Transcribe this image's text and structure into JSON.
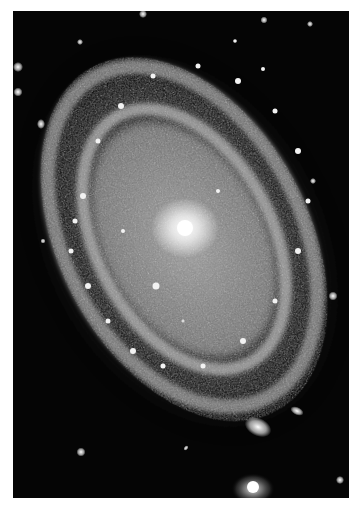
{
  "image": {
    "subject": "spiral galaxy",
    "colors": {
      "background": "#050505",
      "border": "#ffffff",
      "core": "#ffffff",
      "arms": "#bdbdbd"
    },
    "stars": [
      {
        "x": 5,
        "y": 56,
        "r": 2.5
      },
      {
        "x": 5,
        "y": 81,
        "r": 2.2
      },
      {
        "x": 28,
        "y": 113,
        "r": 2.5
      },
      {
        "x": 67,
        "y": 31,
        "r": 1.6
      },
      {
        "x": 130,
        "y": 3,
        "r": 2
      },
      {
        "x": 251,
        "y": 9,
        "r": 1.8
      },
      {
        "x": 297,
        "y": 13,
        "r": 1.5
      },
      {
        "x": 68,
        "y": 441,
        "r": 2.5
      },
      {
        "x": 173,
        "y": 437,
        "r": 1.6
      },
      {
        "x": 283,
        "y": 400,
        "r": 3
      },
      {
        "x": 327,
        "y": 469,
        "r": 2.2
      },
      {
        "x": 320,
        "y": 285,
        "r": 2.5
      },
      {
        "x": 300,
        "y": 170,
        "r": 1.8
      },
      {
        "x": 30,
        "y": 230,
        "r": 1.5
      }
    ],
    "companions": [
      {
        "x": 245,
        "y": 416,
        "rx": 12,
        "ry": 8
      },
      {
        "x": 240,
        "y": 478,
        "rx": 18,
        "ry": 14
      }
    ]
  }
}
